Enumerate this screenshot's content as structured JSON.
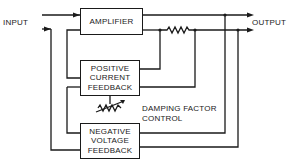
{
  "diagram": {
    "input_label": "INPUT",
    "output_label": "OUTPUT",
    "blocks": {
      "amplifier": "AMPLIFIER",
      "positive_current_feedback": [
        "POSITIVE",
        "CURRENT",
        "FEEDBACK"
      ],
      "negative_voltage_feedback": [
        "NEGATIVE",
        "VOLTAGE",
        "FEEDBACK"
      ]
    },
    "control_label": [
      "DAMPING FACTOR",
      "CONTROL"
    ],
    "line_color": "#1a1a1a"
  }
}
